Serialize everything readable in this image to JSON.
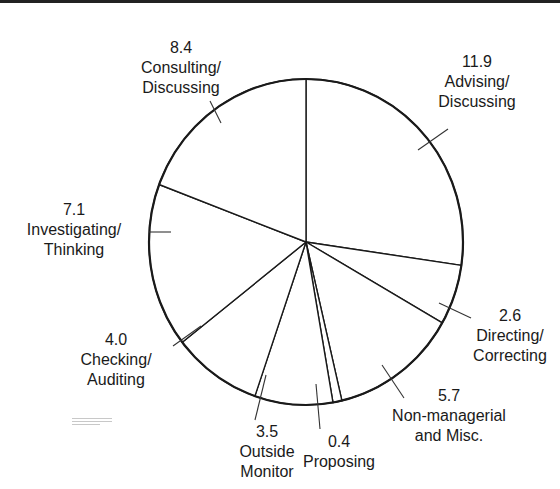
{
  "chart_data": {
    "type": "pie",
    "title": "",
    "start_angle": "top",
    "direction": "clockwise",
    "unit": "",
    "total": 43.6,
    "categories": [
      "Advising/Discussing",
      "Directing/Correcting",
      "Non-managerial and Misc.",
      "Proposing",
      "Outside Monitor",
      "Checking/Auditing",
      "Investigating/Thinking",
      "Consulting/Discussing"
    ],
    "values": [
      11.9,
      2.6,
      5.7,
      0.4,
      3.5,
      4.0,
      7.1,
      8.4
    ],
    "legend": "none (labels placed outside slices with leader lines)",
    "fill_color": "#ffffff",
    "stroke_color": "#1a1a1a"
  },
  "labels": [
    {
      "value": "11.9",
      "line1": "Advising/",
      "line2": "Discussing"
    },
    {
      "value": "2.6",
      "line1": "Directing/",
      "line2": "Correcting"
    },
    {
      "value": "5.7",
      "line1": "Non-managerial",
      "line2": "and Misc."
    },
    {
      "value": "0.4",
      "line1": "Proposing",
      "line2": ""
    },
    {
      "value": "3.5",
      "line1": "Outside",
      "line2": "Monitor"
    },
    {
      "value": "4.0",
      "line1": "Checking/",
      "line2": "Auditing"
    },
    {
      "value": "7.1",
      "line1": "Investigating/",
      "line2": "Thinking"
    },
    {
      "value": "8.4",
      "line1": "Consulting/",
      "line2": "Discussing"
    }
  ]
}
